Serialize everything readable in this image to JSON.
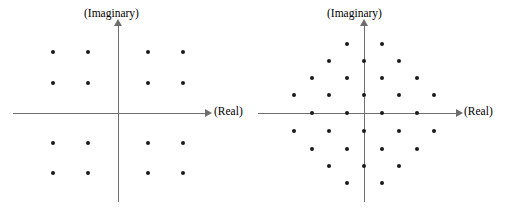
{
  "figure": {
    "background_color": "#ffffff",
    "axis_color": "#6e6e6e",
    "point_color": "#1a1a1a",
    "width": 515,
    "height": 217
  },
  "panels": [
    {
      "id": "left",
      "name": "rectangular-16-point-constellation",
      "labels": {
        "real": "(Real)",
        "imaginary": "(Imaginary)"
      },
      "origin": {
        "x": 118,
        "y": 113
      },
      "axes": {
        "h": {
          "x": 13,
          "y": 113,
          "length": 192
        },
        "v": {
          "x": 118,
          "y": 26,
          "length": 176
        },
        "arrow_h": {
          "x": 205,
          "y": 109
        },
        "arrow_v": {
          "x": 114,
          "y": 19
        },
        "label_real": {
          "x": 214,
          "y": 106
        },
        "label_imaginary": {
          "x": 84,
          "y": 8
        }
      }
    },
    {
      "id": "right",
      "name": "hexagonal-32-point-constellation",
      "labels": {
        "real": "(Real)",
        "imaginary": "(Imaginary)"
      },
      "origin": {
        "x": 364,
        "y": 113
      },
      "axes": {
        "h": {
          "x": 258,
          "y": 113,
          "length": 198
        },
        "v": {
          "x": 364,
          "y": 26,
          "length": 176
        },
        "arrow_h": {
          "x": 456,
          "y": 109
        },
        "arrow_v": {
          "x": 360,
          "y": 19
        },
        "label_real": {
          "x": 464,
          "y": 106
        },
        "label_imaginary": {
          "x": 327,
          "y": 8
        }
      }
    }
  ],
  "chart_data": [
    {
      "type": "scatter",
      "name": "rectangular-constellation",
      "title": "",
      "xlabel": "(Real)",
      "ylabel": "(Imaginary)",
      "grid": false,
      "legend": "none",
      "lattice": "rectangular",
      "point_count": 16,
      "xlim": [
        -3,
        3
      ],
      "ylim": [
        -3,
        3
      ],
      "points_px": [
        {
          "x": 53,
          "y": 52
        },
        {
          "x": 88,
          "y": 52
        },
        {
          "x": 148,
          "y": 52
        },
        {
          "x": 183,
          "y": 52
        },
        {
          "x": 53,
          "y": 83
        },
        {
          "x": 88,
          "y": 83
        },
        {
          "x": 148,
          "y": 83
        },
        {
          "x": 183,
          "y": 83
        },
        {
          "x": 53,
          "y": 143
        },
        {
          "x": 88,
          "y": 143
        },
        {
          "x": 148,
          "y": 143
        },
        {
          "x": 183,
          "y": 143
        },
        {
          "x": 53,
          "y": 173
        },
        {
          "x": 88,
          "y": 173
        },
        {
          "x": 148,
          "y": 173
        },
        {
          "x": 183,
          "y": 173
        }
      ],
      "points": [
        {
          "x": -3,
          "y": 3
        },
        {
          "x": -1,
          "y": 3
        },
        {
          "x": 1,
          "y": 3
        },
        {
          "x": 3,
          "y": 3
        },
        {
          "x": -3,
          "y": 1
        },
        {
          "x": -1,
          "y": 1
        },
        {
          "x": 1,
          "y": 1
        },
        {
          "x": 3,
          "y": 1
        },
        {
          "x": -3,
          "y": -1
        },
        {
          "x": -1,
          "y": -1
        },
        {
          "x": 1,
          "y": -1
        },
        {
          "x": 3,
          "y": -1
        },
        {
          "x": -3,
          "y": -3
        },
        {
          "x": -1,
          "y": -3
        },
        {
          "x": 1,
          "y": -3
        },
        {
          "x": 3,
          "y": -3
        }
      ]
    },
    {
      "type": "scatter",
      "name": "hexagonal-constellation",
      "title": "",
      "xlabel": "(Real)",
      "ylabel": "(Imaginary)",
      "grid": false,
      "legend": "none",
      "lattice": "hexagonal",
      "point_count": 32,
      "xlim": [
        -5,
        5
      ],
      "ylim": [
        -4,
        4
      ],
      "points_px": [
        {
          "x": 347,
          "y": 44
        },
        {
          "x": 382,
          "y": 44
        },
        {
          "x": 329,
          "y": 61
        },
        {
          "x": 364,
          "y": 61
        },
        {
          "x": 399,
          "y": 61
        },
        {
          "x": 312,
          "y": 78
        },
        {
          "x": 347,
          "y": 78
        },
        {
          "x": 382,
          "y": 78
        },
        {
          "x": 417,
          "y": 78
        },
        {
          "x": 294,
          "y": 95
        },
        {
          "x": 329,
          "y": 95
        },
        {
          "x": 364,
          "y": 95
        },
        {
          "x": 399,
          "y": 95
        },
        {
          "x": 434,
          "y": 95
        },
        {
          "x": 312,
          "y": 113
        },
        {
          "x": 347,
          "y": 113
        },
        {
          "x": 382,
          "y": 113
        },
        {
          "x": 417,
          "y": 113
        },
        {
          "x": 294,
          "y": 131
        },
        {
          "x": 329,
          "y": 131
        },
        {
          "x": 364,
          "y": 131
        },
        {
          "x": 399,
          "y": 131
        },
        {
          "x": 434,
          "y": 131
        },
        {
          "x": 312,
          "y": 149
        },
        {
          "x": 347,
          "y": 149
        },
        {
          "x": 382,
          "y": 149
        },
        {
          "x": 417,
          "y": 149
        },
        {
          "x": 329,
          "y": 166
        },
        {
          "x": 364,
          "y": 166
        },
        {
          "x": 399,
          "y": 166
        },
        {
          "x": 347,
          "y": 183
        },
        {
          "x": 382,
          "y": 183
        }
      ],
      "points": [
        {
          "x": -0.5,
          "y": 4
        },
        {
          "x": 0.5,
          "y": 4
        },
        {
          "x": -1,
          "y": 3
        },
        {
          "x": 0,
          "y": 3
        },
        {
          "x": 1,
          "y": 3
        },
        {
          "x": -1.5,
          "y": 2
        },
        {
          "x": -0.5,
          "y": 2
        },
        {
          "x": 0.5,
          "y": 2
        },
        {
          "x": 1.5,
          "y": 2
        },
        {
          "x": -2,
          "y": 1
        },
        {
          "x": -1,
          "y": 1
        },
        {
          "x": 0,
          "y": 1
        },
        {
          "x": 1,
          "y": 1
        },
        {
          "x": 2,
          "y": 1
        },
        {
          "x": -1.5,
          "y": 0
        },
        {
          "x": -0.5,
          "y": 0
        },
        {
          "x": 0.5,
          "y": 0
        },
        {
          "x": 1.5,
          "y": 0
        },
        {
          "x": -2,
          "y": -1
        },
        {
          "x": -1,
          "y": -1
        },
        {
          "x": 0,
          "y": -1
        },
        {
          "x": 1,
          "y": -1
        },
        {
          "x": 2,
          "y": -1
        },
        {
          "x": -1.5,
          "y": -2
        },
        {
          "x": -0.5,
          "y": -2
        },
        {
          "x": 0.5,
          "y": -2
        },
        {
          "x": 1.5,
          "y": -2
        },
        {
          "x": -1,
          "y": -3
        },
        {
          "x": 0,
          "y": -3
        },
        {
          "x": 1,
          "y": -3
        },
        {
          "x": -0.5,
          "y": -4
        },
        {
          "x": 0.5,
          "y": -4
        }
      ]
    }
  ]
}
